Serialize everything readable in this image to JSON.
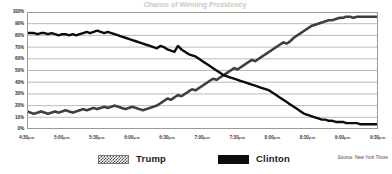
{
  "chart_data": {
    "type": "line",
    "title": "Chance of Winning Presidency",
    "xlabel": "",
    "ylabel": "",
    "ylim": [
      0,
      100
    ],
    "ytick_labels": [
      "100%",
      "90%",
      "80%",
      "70%",
      "60%",
      "50%",
      "40%",
      "30%",
      "20%",
      "10%",
      "0%"
    ],
    "ytick_values": [
      100,
      90,
      80,
      70,
      60,
      50,
      40,
      30,
      20,
      10,
      0
    ],
    "xtick_labels": [
      "4:30",
      "5:00",
      "5:30",
      "6:00",
      "6:30",
      "7:00",
      "7:30",
      "8:00",
      "8:30",
      "9:00",
      "9:30"
    ],
    "xtick_suffix": "p.m.",
    "grid": true,
    "legend_position": "bottom",
    "x": [
      0,
      1,
      2,
      3,
      4,
      5,
      6,
      7,
      8,
      9,
      10,
      11,
      12,
      13,
      14,
      15,
      16,
      17,
      18,
      19,
      20,
      21,
      22,
      23,
      24,
      25,
      26,
      27,
      28,
      29,
      30,
      31,
      32,
      33,
      34,
      35,
      36,
      37,
      38,
      39,
      40,
      41,
      42,
      43,
      44,
      45,
      46,
      47,
      48,
      49,
      50,
      51,
      52,
      53,
      54,
      55,
      56,
      57,
      58,
      59,
      60,
      61,
      62,
      63,
      64,
      65,
      66,
      67,
      68,
      69,
      70,
      71,
      72,
      73,
      74,
      75,
      76,
      77,
      78,
      79,
      80,
      81,
      82,
      83,
      84,
      85,
      86,
      87,
      88,
      89,
      90,
      91,
      92,
      93,
      94,
      95,
      96,
      97,
      98,
      99,
      100
    ],
    "series": [
      {
        "name": "Trump",
        "color": "#3f3f3f",
        "style": "dotted",
        "values": [
          15,
          14,
          13,
          14,
          15,
          14,
          13,
          14,
          15,
          14,
          15,
          16,
          15,
          14,
          15,
          16,
          17,
          16,
          17,
          18,
          17,
          18,
          19,
          18,
          19,
          20,
          19,
          18,
          17,
          18,
          19,
          18,
          17,
          16,
          17,
          18,
          19,
          20,
          22,
          24,
          26,
          25,
          27,
          29,
          28,
          30,
          32,
          34,
          33,
          35,
          37,
          39,
          41,
          43,
          42,
          44,
          46,
          48,
          50,
          52,
          51,
          53,
          55,
          57,
          59,
          58,
          60,
          62,
          64,
          66,
          68,
          70,
          72,
          74,
          73,
          75,
          78,
          80,
          82,
          84,
          86,
          88,
          89,
          90,
          91,
          92,
          93,
          93,
          94,
          95,
          95,
          96,
          96,
          95,
          96,
          96,
          96,
          96,
          96,
          96,
          96
        ]
      },
      {
        "name": "Clinton",
        "color": "#0d0d0d",
        "style": "solid",
        "values": [
          82,
          82,
          82,
          81,
          82,
          82,
          81,
          82,
          81,
          80,
          81,
          81,
          80,
          81,
          80,
          81,
          82,
          83,
          82,
          83,
          84,
          83,
          82,
          83,
          82,
          81,
          80,
          79,
          78,
          77,
          76,
          75,
          74,
          73,
          72,
          71,
          70,
          69,
          71,
          70,
          68,
          67,
          66,
          71,
          68,
          66,
          64,
          63,
          62,
          60,
          58,
          56,
          54,
          52,
          50,
          48,
          46,
          45,
          44,
          43,
          42,
          41,
          40,
          39,
          38,
          37,
          36,
          35,
          34,
          33,
          31,
          29,
          27,
          25,
          23,
          21,
          19,
          17,
          15,
          13,
          12,
          11,
          10,
          9,
          8,
          8,
          7,
          7,
          6,
          6,
          6,
          5,
          5,
          5,
          5,
          4,
          4,
          4,
          4,
          4,
          4
        ]
      }
    ],
    "annotations": {
      "crossover_label": "50%"
    }
  },
  "source": {
    "prefix": "Source:",
    "publication": "New York Times"
  },
  "legend": {
    "items": [
      {
        "label": "Trump",
        "swatch": "checkered-swatch"
      },
      {
        "label": "Clinton",
        "swatch": "solid-black-swatch"
      }
    ]
  }
}
